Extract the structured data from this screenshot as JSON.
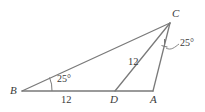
{
  "figure": {
    "type": "geometry-diagram",
    "stroke_color": "#7a7a7a",
    "text_color": "#3a3a3a",
    "background": "#ffffff",
    "vertices": [
      {
        "name": "B",
        "label": "B",
        "x": 22,
        "y": 91
      },
      {
        "name": "D",
        "label": "D",
        "x": 115,
        "y": 91
      },
      {
        "name": "A",
        "label": "A",
        "x": 153,
        "y": 91
      },
      {
        "name": "C",
        "label": "C",
        "x": 170,
        "y": 23
      }
    ],
    "segments": [
      {
        "name": "segment-BC",
        "from": "B",
        "to": "C"
      },
      {
        "name": "segment-BA",
        "from": "B",
        "to": "A"
      },
      {
        "name": "segment-CA",
        "from": "C",
        "to": "A"
      },
      {
        "name": "segment-DC",
        "from": "D",
        "to": "C"
      }
    ],
    "labels": {
      "vertex_b": "B",
      "vertex_d": "D",
      "vertex_a": "A",
      "vertex_c": "C"
    },
    "measures": {
      "side_bd": "12",
      "side_dc": "12",
      "angle_b": "25°",
      "angle_dca": "25°"
    }
  }
}
